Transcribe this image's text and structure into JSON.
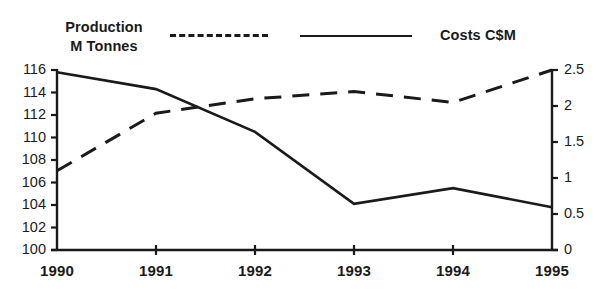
{
  "chart_data": {
    "type": "line",
    "title": "",
    "subtitle": "",
    "xlabel": "",
    "categories": [
      "1990",
      "1991",
      "1992",
      "1993",
      "1994",
      "1995"
    ],
    "grid": false,
    "legend_position": "top",
    "series": [
      {
        "name": "Production M Tonnes",
        "style": "dashed",
        "axis": "right",
        "ylabel": "Production M Tonnes",
        "color": "#1a1a1a",
        "values": [
          1.1,
          1.9,
          2.1,
          2.2,
          2.05,
          2.5
        ]
      },
      {
        "name": "Costs C$M",
        "style": "solid",
        "axis": "left",
        "ylabel": "Costs C$M",
        "color": "#1a1a1a",
        "values": [
          115.8,
          114.3,
          110.5,
          104.1,
          105.5,
          103.8
        ]
      }
    ],
    "left_axis": {
      "label": "Costs C$M",
      "ylim": [
        100,
        116
      ],
      "tick_step": 2,
      "ticks": [
        "116",
        "114",
        "112",
        "110",
        "108",
        "106",
        "104",
        "102",
        "100"
      ],
      "tick_values": [
        116,
        114,
        112,
        110,
        108,
        106,
        104,
        102,
        100
      ]
    },
    "right_axis": {
      "label": "Production M Tonnes",
      "ylim": [
        0,
        2.5
      ],
      "tick_step": 0.5,
      "ticks": [
        "2.5",
        "2",
        "1.5",
        "1",
        "0.5",
        "0"
      ],
      "tick_values": [
        2.5,
        2,
        1.5,
        1,
        0.5,
        0
      ]
    }
  },
  "legend": {
    "left_series_label_line1": "Production",
    "left_series_label_line2": "M Tonnes",
    "right_series_label": "Costs C$M",
    "dashed_swatch_name": "dashed-line-swatch",
    "solid_swatch_name": "solid-line-swatch"
  },
  "artifact": {
    "top_fragment": ""
  }
}
